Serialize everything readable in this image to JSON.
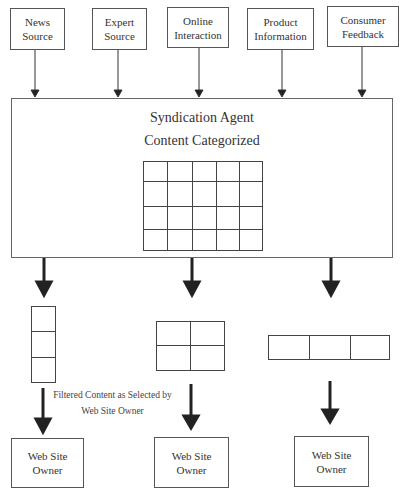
{
  "sources": [
    {
      "id": "news",
      "lines": [
        "News",
        "Source"
      ]
    },
    {
      "id": "expert",
      "lines": [
        "Expert",
        "Source"
      ]
    },
    {
      "id": "online",
      "lines": [
        "Online",
        "Interaction"
      ]
    },
    {
      "id": "product",
      "lines": [
        "Product",
        "Information"
      ]
    },
    {
      "id": "consumer",
      "lines": [
        "Consumer",
        "Feedback"
      ]
    }
  ],
  "agent": {
    "title": "Syndication Agent",
    "subtitle": "Content Categorized",
    "grid": {
      "cols": 5,
      "rows": 4
    }
  },
  "filtered_grids": [
    {
      "cols": 1,
      "rows": 3
    },
    {
      "cols": 2,
      "rows": 2
    },
    {
      "cols": 3,
      "rows": 1
    }
  ],
  "caption": {
    "line1": "Filtered Content as Selected by",
    "line2": "Web Site Owner"
  },
  "owners": [
    {
      "lines": [
        "Web Site",
        "Owner"
      ]
    },
    {
      "lines": [
        "Web Site",
        "Owner"
      ]
    },
    {
      "lines": [
        "Web Site",
        "Owner"
      ]
    }
  ],
  "colors": {
    "line": "#444444",
    "arrow": "#222222",
    "background": "#ffffff"
  }
}
